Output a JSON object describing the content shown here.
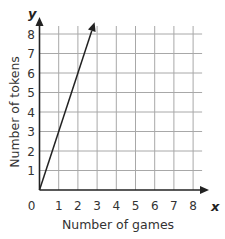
{
  "chart_data": {
    "type": "line",
    "title": "",
    "xlabel": "Number of games",
    "ylabel": "Number of tokens",
    "x_axis_variable": "x",
    "y_axis_variable": "y",
    "xlim": [
      0,
      8
    ],
    "ylim": [
      0,
      8
    ],
    "x_ticks": [
      "0",
      "1",
      "2",
      "3",
      "4",
      "5",
      "6",
      "7",
      "8"
    ],
    "y_ticks": [
      "1",
      "2",
      "3",
      "4",
      "5",
      "6",
      "7",
      "8"
    ],
    "grid": true,
    "legend": null,
    "series": [
      {
        "name": "tokens",
        "equation": "y = 3x",
        "x": [
          0,
          1,
          2,
          2.87
        ],
        "y": [
          0,
          3,
          6,
          8.6
        ],
        "arrow_end": true
      }
    ]
  },
  "colors": {
    "grid": "#a8a8a8",
    "axis": "#222222",
    "line": "#222222",
    "text": "#333333"
  }
}
